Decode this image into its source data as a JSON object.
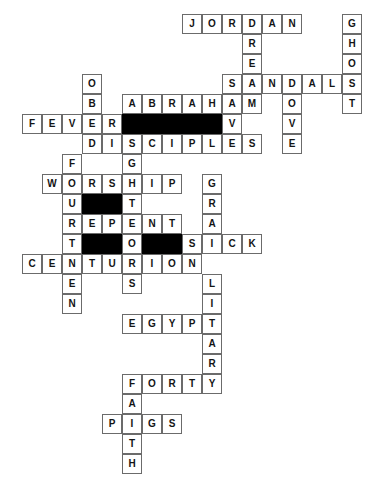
{
  "puzzle": {
    "title": "Bible Crossword Grid",
    "type": "crossword",
    "cell_size": 20,
    "origin_x": 22,
    "origin_y": 14,
    "columns": 18,
    "rows": 24,
    "colors": {
      "cell_fill": "#ffffff",
      "cell_border": "#6b6b6b",
      "block_fill": "#000000",
      "letter": "#141414"
    },
    "entries": [
      {
        "answer": "JORDAN",
        "direction": "across",
        "row": 0,
        "col": 8
      },
      {
        "answer": "GHOST",
        "direction": "down",
        "row": 0,
        "col": 16
      },
      {
        "answer": "DRESS",
        "direction": "down",
        "row": 0,
        "col": 11
      },
      {
        "answer": "OBEDIENCE",
        "direction": "down",
        "row": 3,
        "col": 3
      },
      {
        "answer": "SANDALS",
        "direction": "across",
        "row": 3,
        "col": 10
      },
      {
        "answer": "ABRAHAM",
        "direction": "across",
        "row": 4,
        "col": 5
      },
      {
        "answer": "DOVE",
        "direction": "down",
        "row": 3,
        "col": 13
      },
      {
        "answer": "MOVES",
        "direction": "down",
        "row": 4,
        "col": 12
      },
      {
        "answer": "FEVER",
        "direction": "across",
        "row": 5,
        "col": 0
      },
      {
        "answer": "DISCIPLES",
        "direction": "across",
        "row": 6,
        "col": 3
      },
      {
        "answer": "FURTHER",
        "direction": "down",
        "row": 7,
        "col": 2
      },
      {
        "answer": "GHOST",
        "direction": "down",
        "row": 7,
        "col": 5
      },
      {
        "answer": "WORSHIP",
        "direction": "across",
        "row": 8,
        "col": 1
      },
      {
        "answer": "GRAIN",
        "direction": "down",
        "row": 8,
        "col": 9
      },
      {
        "answer": "REPENT",
        "direction": "across",
        "row": 10,
        "col": 2
      },
      {
        "answer": "SICK",
        "direction": "across",
        "row": 11,
        "col": 9
      },
      {
        "answer": "CENTURION",
        "direction": "across",
        "row": 12,
        "col": 0
      },
      {
        "answer": "GREEN",
        "direction": "down",
        "row": 10,
        "col": 2
      },
      {
        "answer": "SOLDIER",
        "direction": "down",
        "row": 12,
        "col": 9
      },
      {
        "answer": "EGYPT",
        "direction": "across",
        "row": 15,
        "col": 3
      },
      {
        "answer": "FORTY",
        "direction": "across",
        "row": 18,
        "col": 3
      },
      {
        "answer": "FAITH",
        "direction": "down",
        "row": 18,
        "col": 3
      },
      {
        "answer": "PIGS",
        "direction": "across",
        "row": 20,
        "col": 2
      }
    ],
    "cells": [
      {
        "r": 0,
        "c": 8,
        "ch": "J"
      },
      {
        "r": 0,
        "c": 9,
        "ch": "O"
      },
      {
        "r": 0,
        "c": 10,
        "ch": "R"
      },
      {
        "r": 0,
        "c": 11,
        "ch": "D"
      },
      {
        "r": 0,
        "c": 12,
        "ch": "A"
      },
      {
        "r": 0,
        "c": 13,
        "ch": "N"
      },
      {
        "r": 0,
        "c": 16,
        "ch": "G"
      },
      {
        "r": 1,
        "c": 11,
        "ch": "R"
      },
      {
        "r": 1,
        "c": 16,
        "ch": "H"
      },
      {
        "r": 2,
        "c": 11,
        "ch": "E"
      },
      {
        "r": 2,
        "c": 16,
        "ch": "O"
      },
      {
        "r": 3,
        "c": 3,
        "ch": "O"
      },
      {
        "r": 3,
        "c": 10,
        "ch": "S"
      },
      {
        "r": 3,
        "c": 11,
        "ch": "A"
      },
      {
        "r": 3,
        "c": 12,
        "ch": "N"
      },
      {
        "r": 3,
        "c": 13,
        "ch": "D"
      },
      {
        "r": 3,
        "c": 14,
        "ch": "A"
      },
      {
        "r": 3,
        "c": 15,
        "ch": "L"
      },
      {
        "r": 3,
        "c": 16,
        "ch": "S"
      },
      {
        "r": 4,
        "c": 3,
        "ch": "B"
      },
      {
        "r": 4,
        "c": 5,
        "ch": "A"
      },
      {
        "r": 4,
        "c": 6,
        "ch": "B"
      },
      {
        "r": 4,
        "c": 7,
        "ch": "R"
      },
      {
        "r": 4,
        "c": 8,
        "ch": "A"
      },
      {
        "r": 4,
        "c": 9,
        "ch": "H"
      },
      {
        "r": 4,
        "c": 10,
        "ch": "A"
      },
      {
        "r": 4,
        "c": 11,
        "ch": "M"
      },
      {
        "r": 4,
        "c": 13,
        "ch": "O"
      },
      {
        "r": 4,
        "c": 16,
        "ch": "T"
      },
      {
        "r": 5,
        "c": 0,
        "ch": "F"
      },
      {
        "r": 5,
        "c": 1,
        "ch": "E"
      },
      {
        "r": 5,
        "c": 2,
        "ch": "V"
      },
      {
        "r": 5,
        "c": 3,
        "ch": "E"
      },
      {
        "r": 5,
        "c": 4,
        "ch": "R"
      },
      {
        "r": 5,
        "c": 5,
        "ch": "",
        "block": true
      },
      {
        "r": 5,
        "c": 6,
        "ch": "",
        "block": true
      },
      {
        "r": 5,
        "c": 7,
        "ch": "",
        "block": true
      },
      {
        "r": 5,
        "c": 8,
        "ch": "",
        "block": true
      },
      {
        "r": 5,
        "c": 9,
        "ch": "",
        "block": true
      },
      {
        "r": 5,
        "c": 10,
        "ch": "V"
      },
      {
        "r": 5,
        "c": 13,
        "ch": "V"
      },
      {
        "r": 6,
        "c": 3,
        "ch": "D"
      },
      {
        "r": 6,
        "c": 4,
        "ch": "I"
      },
      {
        "r": 6,
        "c": 5,
        "ch": "S"
      },
      {
        "r": 6,
        "c": 6,
        "ch": "C"
      },
      {
        "r": 6,
        "c": 7,
        "ch": "I"
      },
      {
        "r": 6,
        "c": 8,
        "ch": "P"
      },
      {
        "r": 6,
        "c": 9,
        "ch": "L"
      },
      {
        "r": 6,
        "c": 10,
        "ch": "E"
      },
      {
        "r": 6,
        "c": 11,
        "ch": "S"
      },
      {
        "r": 6,
        "c": 13,
        "ch": "E"
      },
      {
        "r": 7,
        "c": 2,
        "ch": "F"
      },
      {
        "r": 7,
        "c": 5,
        "ch": "G"
      },
      {
        "r": 8,
        "c": 1,
        "ch": "W"
      },
      {
        "r": 8,
        "c": 2,
        "ch": "O"
      },
      {
        "r": 8,
        "c": 3,
        "ch": "R"
      },
      {
        "r": 8,
        "c": 4,
        "ch": "S"
      },
      {
        "r": 8,
        "c": 5,
        "ch": "H"
      },
      {
        "r": 8,
        "c": 6,
        "ch": "I"
      },
      {
        "r": 8,
        "c": 7,
        "ch": "P"
      },
      {
        "r": 8,
        "c": 9,
        "ch": "G"
      },
      {
        "r": 9,
        "c": 2,
        "ch": "U"
      },
      {
        "r": 9,
        "c": 3,
        "ch": "",
        "block": true
      },
      {
        "r": 9,
        "c": 4,
        "ch": "",
        "block": true
      },
      {
        "r": 9,
        "c": 5,
        "ch": "T"
      },
      {
        "r": 9,
        "c": 9,
        "ch": "R"
      },
      {
        "r": 10,
        "c": 2,
        "ch": "R"
      },
      {
        "r": 10,
        "c": 3,
        "ch": "E"
      },
      {
        "r": 10,
        "c": 4,
        "ch": "P"
      },
      {
        "r": 10,
        "c": 5,
        "ch": "E"
      },
      {
        "r": 10,
        "c": 6,
        "ch": "N"
      },
      {
        "r": 10,
        "c": 7,
        "ch": "T"
      },
      {
        "r": 10,
        "c": 9,
        "ch": "A"
      },
      {
        "r": 11,
        "c": 2,
        "ch": "T"
      },
      {
        "r": 11,
        "c": 3,
        "ch": "",
        "block": true
      },
      {
        "r": 11,
        "c": 4,
        "ch": "",
        "block": true
      },
      {
        "r": 11,
        "c": 5,
        "ch": "O"
      },
      {
        "r": 11,
        "c": 6,
        "ch": "",
        "block": true
      },
      {
        "r": 11,
        "c": 7,
        "ch": "",
        "block": true
      },
      {
        "r": 11,
        "c": 8,
        "ch": "S"
      },
      {
        "r": 11,
        "c": 9,
        "ch": "I"
      },
      {
        "r": 11,
        "c": 10,
        "ch": "C"
      },
      {
        "r": 11,
        "c": 11,
        "ch": "K"
      },
      {
        "r": 12,
        "c": 0,
        "ch": "C"
      },
      {
        "r": 12,
        "c": 1,
        "ch": "E"
      },
      {
        "r": 12,
        "c": 2,
        "ch": "N"
      },
      {
        "r": 12,
        "c": 3,
        "ch": "T"
      },
      {
        "r": 12,
        "c": 4,
        "ch": "U"
      },
      {
        "r": 12,
        "c": 5,
        "ch": "R"
      },
      {
        "r": 12,
        "c": 6,
        "ch": "I"
      },
      {
        "r": 12,
        "c": 7,
        "ch": "O"
      },
      {
        "r": 12,
        "c": 8,
        "ch": "N"
      },
      {
        "r": 13,
        "c": 2,
        "ch": "E"
      },
      {
        "r": 13,
        "c": 5,
        "ch": "S"
      },
      {
        "r": 13,
        "c": 9,
        "ch": "L"
      },
      {
        "r": 14,
        "c": 2,
        "ch": "N"
      },
      {
        "r": 14,
        "c": 9,
        "ch": "I"
      },
      {
        "r": 15,
        "c": 5,
        "ch": "E"
      },
      {
        "r": 15,
        "c": 6,
        "ch": "G"
      },
      {
        "r": 15,
        "c": 7,
        "ch": "Y"
      },
      {
        "r": 15,
        "c": 8,
        "ch": "P"
      },
      {
        "r": 15,
        "c": 9,
        "ch": "T"
      },
      {
        "r": 16,
        "c": 9,
        "ch": "A"
      },
      {
        "r": 17,
        "c": 9,
        "ch": "R"
      },
      {
        "r": 18,
        "c": 5,
        "ch": "F"
      },
      {
        "r": 18,
        "c": 6,
        "ch": "O"
      },
      {
        "r": 18,
        "c": 7,
        "ch": "R"
      },
      {
        "r": 18,
        "c": 8,
        "ch": "T"
      },
      {
        "r": 18,
        "c": 9,
        "ch": "Y"
      },
      {
        "r": 19,
        "c": 5,
        "ch": "A"
      },
      {
        "r": 20,
        "c": 4,
        "ch": "P"
      },
      {
        "r": 20,
        "c": 5,
        "ch": "I"
      },
      {
        "r": 20,
        "c": 6,
        "ch": "G"
      },
      {
        "r": 20,
        "c": 7,
        "ch": "S"
      },
      {
        "r": 21,
        "c": 5,
        "ch": "T"
      },
      {
        "r": 22,
        "c": 5,
        "ch": "H"
      }
    ]
  }
}
